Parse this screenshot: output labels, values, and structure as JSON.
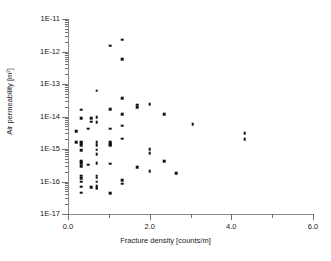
{
  "chart_data": {
    "type": "scatter",
    "title": "",
    "xlabel": "Fracture density [counts/m]",
    "ylabel": "Air permeability [m²]",
    "xlim": [
      0.0,
      6.0
    ],
    "ylim": [
      1e-17,
      1e-11
    ],
    "yscale": "log",
    "xscale": "linear",
    "grid": false,
    "legend": null,
    "x_ticks_major": [
      0.0,
      2.0,
      4.0,
      6.0
    ],
    "x_ticks_minor": [
      1.0,
      3.0,
      5.0
    ],
    "x_tick_labels": [
      "0.0",
      "2.0",
      "4.0",
      "6.0"
    ],
    "y_ticks_major": [
      1e-11,
      1e-12,
      1e-13,
      1e-14,
      1e-15,
      1e-16,
      1e-17
    ],
    "y_tick_labels": [
      "1E-11",
      "1E-12",
      "1E-13",
      "1E-14",
      "1E-15",
      "1E-16",
      "1E-17"
    ],
    "marker": "square",
    "marker_color": "#111111",
    "points": [
      {
        "x": 1.33,
        "y": 2.3e-12
      },
      {
        "x": 1.03,
        "y": 1.5e-12
      },
      {
        "x": 1.33,
        "y": 5.8e-13
      },
      {
        "x": 0.7,
        "y": 6.3e-14
      },
      {
        "x": 1.33,
        "y": 3.7e-14
      },
      {
        "x": 2.0,
        "y": 2.4e-14
      },
      {
        "x": 1.7,
        "y": 2.3e-14
      },
      {
        "x": 1.7,
        "y": 1.9e-14
      },
      {
        "x": 0.33,
        "y": 1.6e-14
      },
      {
        "x": 1.03,
        "y": 1.7e-14
      },
      {
        "x": 2.35,
        "y": 1.2e-14
      },
      {
        "x": 1.33,
        "y": 1.2e-14
      },
      {
        "x": 0.33,
        "y": 9e-15
      },
      {
        "x": 0.57,
        "y": 9e-15
      },
      {
        "x": 0.7,
        "y": 9.5e-15
      },
      {
        "x": 0.57,
        "y": 7e-15
      },
      {
        "x": 0.7,
        "y": 6.8e-15
      },
      {
        "x": 1.33,
        "y": 5.2e-15
      },
      {
        "x": 3.05,
        "y": 5.8e-15
      },
      {
        "x": 1.03,
        "y": 4.2e-15
      },
      {
        "x": 0.5,
        "y": 4.2e-15
      },
      {
        "x": 0.2,
        "y": 3.6e-15
      },
      {
        "x": 4.33,
        "y": 3e-15
      },
      {
        "x": 1.33,
        "y": 2.1e-15
      },
      {
        "x": 4.33,
        "y": 2e-15
      },
      {
        "x": 0.2,
        "y": 1.6e-15
      },
      {
        "x": 0.33,
        "y": 1.7e-15
      },
      {
        "x": 0.33,
        "y": 1.5e-15
      },
      {
        "x": 0.33,
        "y": 1.3e-15
      },
      {
        "x": 0.7,
        "y": 1.6e-15
      },
      {
        "x": 0.7,
        "y": 1.3e-15
      },
      {
        "x": 1.03,
        "y": 1.6e-15
      },
      {
        "x": 1.03,
        "y": 1.4e-15
      },
      {
        "x": 1.03,
        "y": 1.3e-15
      },
      {
        "x": 2.0,
        "y": 1e-15
      },
      {
        "x": 0.33,
        "y": 9e-16
      },
      {
        "x": 0.7,
        "y": 9.5e-16
      },
      {
        "x": 0.7,
        "y": 7e-16
      },
      {
        "x": 2.0,
        "y": 7.5e-16
      },
      {
        "x": 0.33,
        "y": 4.2e-16
      },
      {
        "x": 0.33,
        "y": 3.7e-16
      },
      {
        "x": 0.5,
        "y": 3.3e-16
      },
      {
        "x": 0.7,
        "y": 3.7e-16
      },
      {
        "x": 1.03,
        "y": 3.5e-16
      },
      {
        "x": 2.35,
        "y": 4.2e-16
      },
      {
        "x": 0.33,
        "y": 3e-16
      },
      {
        "x": 1.7,
        "y": 2.8e-16
      },
      {
        "x": 2.0,
        "y": 2.1e-16
      },
      {
        "x": 2.65,
        "y": 1.8e-16
      },
      {
        "x": 0.33,
        "y": 1.5e-16
      },
      {
        "x": 0.33,
        "y": 1.25e-16
      },
      {
        "x": 0.7,
        "y": 1.5e-16
      },
      {
        "x": 0.7,
        "y": 1.3e-16
      },
      {
        "x": 0.33,
        "y": 1e-16
      },
      {
        "x": 0.7,
        "y": 1e-16
      },
      {
        "x": 1.33,
        "y": 1.1e-16
      },
      {
        "x": 1.33,
        "y": 8.5e-17
      },
      {
        "x": 0.33,
        "y": 7e-17
      },
      {
        "x": 0.7,
        "y": 7.2e-17
      },
      {
        "x": 0.7,
        "y": 6.5e-17
      },
      {
        "x": 0.7,
        "y": 6e-17
      },
      {
        "x": 0.57,
        "y": 6.8e-17
      },
      {
        "x": 0.33,
        "y": 4.5e-17
      },
      {
        "x": 1.03,
        "y": 4.3e-17
      }
    ]
  }
}
